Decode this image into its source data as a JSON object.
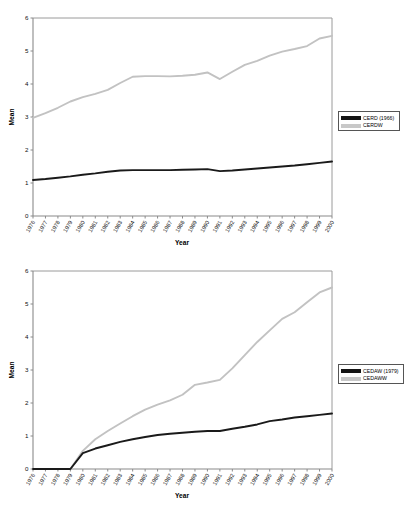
{
  "charts": [
    {
      "id": "cerd-chart",
      "axis": {
        "xlabel": "Year",
        "ylabel": "Mean",
        "yticks": [
          "0",
          "1",
          "2",
          "3",
          "4",
          "5",
          "6"
        ],
        "ylim": [
          0,
          6
        ],
        "grid": false
      },
      "legend": {
        "position": "right",
        "entries": [
          {
            "label": "CERD (1966)",
            "swatch": "dark",
            "color": "#141414"
          },
          {
            "label": "CERDW",
            "swatch": "light",
            "color": "#c8c8c8"
          }
        ]
      },
      "chart_data": {
        "type": "line",
        "title": "",
        "xlabel": "Year",
        "ylabel": "Mean",
        "ylim": [
          0,
          6
        ],
        "grid": false,
        "legend_position": "right",
        "categories": [
          "1976",
          "1977",
          "1978",
          "1979",
          "1980",
          "1981",
          "1982",
          "1983",
          "1984",
          "1985",
          "1986",
          "1987",
          "1988",
          "1989",
          "1990",
          "1991",
          "1992",
          "1993",
          "1994",
          "1995",
          "1996",
          "1997",
          "1998",
          "1999",
          "2000"
        ],
        "series": [
          {
            "name": "CERD (1966)",
            "color": "#141414",
            "values": [
              1.09,
              1.12,
              1.16,
              1.2,
              1.25,
              1.29,
              1.34,
              1.38,
              1.39,
              1.39,
              1.39,
              1.39,
              1.4,
              1.41,
              1.42,
              1.36,
              1.38,
              1.41,
              1.44,
              1.47,
              1.5,
              1.53,
              1.57,
              1.61,
              1.65
            ]
          },
          {
            "name": "CERDW",
            "color": "#c8c8c8",
            "values": [
              2.97,
              3.12,
              3.28,
              3.47,
              3.6,
              3.7,
              3.82,
              4.03,
              4.22,
              4.24,
              4.24,
              4.23,
              4.25,
              4.28,
              4.35,
              4.15,
              4.37,
              4.58,
              4.7,
              4.86,
              4.98,
              5.06,
              5.15,
              5.38,
              5.46
            ]
          }
        ]
      }
    },
    {
      "id": "cedaw-chart",
      "axis": {
        "xlabel": "Year",
        "ylabel": "Mean",
        "yticks": [
          "0",
          "1",
          "2",
          "3",
          "4",
          "5",
          "6"
        ],
        "ylim": [
          0,
          6
        ],
        "grid": false
      },
      "legend": {
        "position": "right",
        "entries": [
          {
            "label": "CEDAW (1979)",
            "swatch": "dark",
            "color": "#141414"
          },
          {
            "label": "CEDAWW",
            "swatch": "light",
            "color": "#c8c8c8"
          }
        ]
      },
      "chart_data": {
        "type": "line",
        "title": "",
        "xlabel": "Year",
        "ylabel": "Mean",
        "ylim": [
          0,
          6
        ],
        "grid": false,
        "legend_position": "right",
        "categories": [
          "1976",
          "1977",
          "1978",
          "1979",
          "1980",
          "1981",
          "1982",
          "1983",
          "1984",
          "1985",
          "1986",
          "1987",
          "1988",
          "1989",
          "1990",
          "1991",
          "1992",
          "1993",
          "1994",
          "1995",
          "1996",
          "1997",
          "1998",
          "1999",
          "2000"
        ],
        "series": [
          {
            "name": "CEDAW (1979)",
            "color": "#141414",
            "values": [
              0.0,
              0.0,
              0.0,
              0.0,
              0.48,
              0.62,
              0.72,
              0.82,
              0.9,
              0.97,
              1.03,
              1.07,
              1.1,
              1.13,
              1.15,
              1.15,
              1.22,
              1.28,
              1.35,
              1.45,
              1.5,
              1.56,
              1.6,
              1.64,
              1.68
            ]
          },
          {
            "name": "CEDAWW",
            "color": "#c8c8c8",
            "values": [
              0.0,
              0.0,
              0.0,
              0.0,
              0.55,
              0.9,
              1.15,
              1.38,
              1.6,
              1.8,
              1.95,
              2.08,
              2.25,
              2.55,
              2.62,
              2.7,
              3.05,
              3.45,
              3.85,
              4.2,
              4.55,
              4.75,
              5.05,
              5.35,
              5.5
            ]
          }
        ]
      }
    }
  ]
}
